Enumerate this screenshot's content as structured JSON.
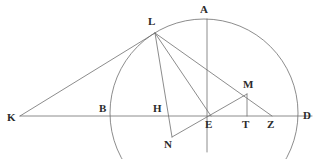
{
  "figure": {
    "kind": "geometry-diagram",
    "width": 317,
    "height": 159,
    "background_color": "#ffffff",
    "stroke_color": "#6e6e6e",
    "label_color": "#2b2b2b",
    "stroke_width": 0.8
  },
  "points": [
    {
      "id": "A",
      "label": "A",
      "x": 207,
      "y": 19,
      "label_x": 200,
      "label_y": 4
    },
    {
      "id": "L",
      "label": "L",
      "x": 155,
      "y": 33,
      "label_x": 148,
      "label_y": 16
    },
    {
      "id": "M",
      "label": "M",
      "x": 247,
      "y": 94,
      "label_x": 243,
      "label_y": 79
    },
    {
      "id": "K",
      "label": "K",
      "x": 20,
      "y": 116,
      "label_x": 7,
      "label_y": 112
    },
    {
      "id": "B",
      "label": "B",
      "x": 110,
      "y": 116,
      "label_x": 99,
      "label_y": 103
    },
    {
      "id": "H",
      "label": "H",
      "x": 165,
      "y": 116,
      "label_x": 153,
      "label_y": 103
    },
    {
      "id": "E",
      "label": "E",
      "x": 211,
      "y": 116,
      "label_x": 205,
      "label_y": 119
    },
    {
      "id": "T",
      "label": "T",
      "x": 247,
      "y": 116,
      "label_x": 242,
      "label_y": 119
    },
    {
      "id": "Z",
      "label": "Z",
      "x": 272,
      "y": 116,
      "label_x": 267,
      "label_y": 119
    },
    {
      "id": "D",
      "label": "D",
      "x": 298,
      "y": 116,
      "label_x": 303,
      "label_y": 110
    },
    {
      "id": "N",
      "label": "N",
      "x": 172,
      "y": 137,
      "label_x": 164,
      "label_y": 139
    }
  ],
  "circle": {
    "name": "main-circle",
    "center_x": 204,
    "center_y": 113,
    "radius": 94
  },
  "segments": [
    {
      "name": "segment-KD",
      "from": "K",
      "to": "D",
      "x1": 20,
      "y1": 116,
      "x2": 312,
      "y2": 116
    },
    {
      "name": "segment-KL",
      "from": "K",
      "to": "L",
      "x1": 20,
      "y1": 116,
      "x2": 155,
      "y2": 33
    },
    {
      "name": "segment-LN",
      "from": "L",
      "to": "N",
      "x1": 155,
      "y1": 33,
      "x2": 172,
      "y2": 137
    },
    {
      "name": "segment-LE",
      "from": "L",
      "to": "E",
      "x1": 155,
      "y1": 33,
      "x2": 211,
      "y2": 116
    },
    {
      "name": "segment-LZ",
      "from": "L",
      "to": "Z",
      "x1": 155,
      "y1": 33,
      "x2": 272,
      "y2": 116
    },
    {
      "name": "segment-NM",
      "from": "N",
      "to": "M",
      "x1": 172,
      "y1": 137,
      "x2": 247,
      "y2": 94
    },
    {
      "name": "segment-MT",
      "from": "M",
      "to": "T",
      "x1": 247,
      "y1": 94,
      "x2": 247,
      "y2": 116
    },
    {
      "name": "segment-AE-vertical",
      "from": "A",
      "to": "E",
      "x1": 207,
      "y1": 19,
      "x2": 207,
      "y2": 152
    }
  ]
}
